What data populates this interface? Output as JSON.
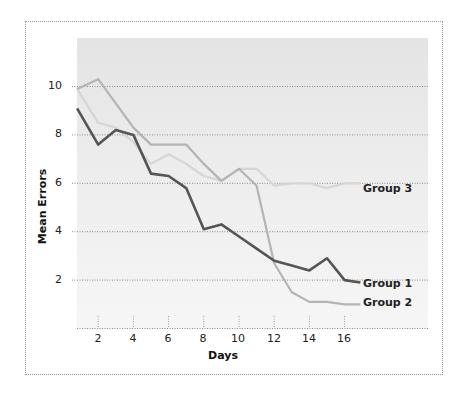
{
  "chart_data": {
    "type": "line",
    "title": "",
    "xlabel": "Days",
    "ylabel": "Mean Errors",
    "xlim": [
      0.8,
      18.7
    ],
    "ylim": [
      0,
      12
    ],
    "x_ticks": [
      2,
      4,
      6,
      8,
      10,
      12,
      14,
      16
    ],
    "y_ticks": [
      2,
      4,
      6,
      8,
      10
    ],
    "grid": "horizontal dotted",
    "legend_position": "inline labels at line ends",
    "x": [
      1,
      2,
      3,
      4,
      5,
      6,
      7,
      8,
      9,
      10,
      11,
      12,
      13,
      14,
      15,
      16,
      17
    ],
    "series": [
      {
        "name": "Group 1",
        "color": "#555555",
        "values": [
          9.1,
          7.6,
          8.2,
          8.0,
          6.4,
          6.3,
          5.8,
          4.1,
          4.3,
          3.8,
          3.3,
          2.8,
          2.6,
          2.4,
          2.9,
          2.0,
          1.9
        ]
      },
      {
        "name": "Group 2",
        "color": "#b4b4b4",
        "values": [
          9.9,
          10.3,
          9.3,
          8.3,
          7.6,
          7.6,
          7.6,
          6.8,
          6.1,
          6.6,
          5.9,
          2.7,
          1.5,
          1.1,
          1.1,
          1.0,
          1.0
        ]
      },
      {
        "name": "Group 3",
        "color": "#d6d6d6",
        "values": [
          9.9,
          8.5,
          8.3,
          7.7,
          6.8,
          7.2,
          6.8,
          6.3,
          6.1,
          6.6,
          6.6,
          5.9,
          6.0,
          6.0,
          5.8,
          6.0,
          6.0
        ]
      }
    ]
  },
  "labels": {
    "xlabel": "Days",
    "ylabel": "Mean Errors",
    "y_ticks": [
      "2",
      "4",
      "6",
      "8",
      "10"
    ],
    "x_ticks": [
      "2",
      "4",
      "6",
      "8",
      "10",
      "12",
      "14",
      "16"
    ],
    "group1": "Group 1",
    "group2": "Group 2",
    "group3": "Group 3"
  }
}
